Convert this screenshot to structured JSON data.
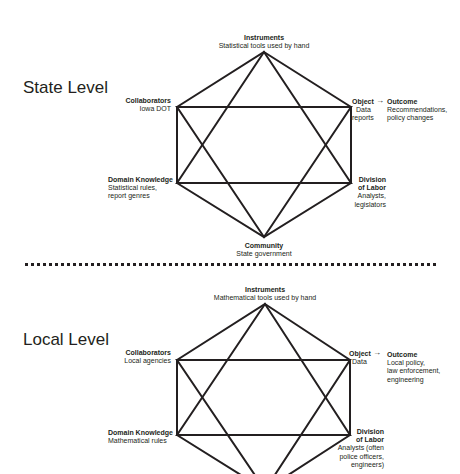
{
  "diagrams": {
    "state": {
      "title": "State Level",
      "instruments": {
        "label": "Instruments",
        "desc": "Statistical tools used by hand"
      },
      "collaborators": {
        "label": "Collaborators",
        "desc": "Iowa DOT"
      },
      "object": {
        "label": "Object",
        "desc1": "Data",
        "desc2": "reports"
      },
      "outcome": {
        "label": "Outcome",
        "desc1": "Recommendations,",
        "desc2": "policy changes"
      },
      "domain_knowledge": {
        "label": "Domain Knowledge",
        "desc1": "Statistical rules,",
        "desc2": "report genres"
      },
      "division_of_labor": {
        "label1": "Division",
        "label2": "of Labor",
        "desc1": "Analysts,",
        "desc2": "legislators"
      },
      "community": {
        "label": "Community",
        "desc": "State government"
      }
    },
    "local": {
      "title": "Local Level",
      "instruments": {
        "label": "Instruments",
        "desc": "Mathematical tools used by hand"
      },
      "collaborators": {
        "label": "Collaborators",
        "desc": "Local agencies"
      },
      "object": {
        "label": "Object",
        "desc1": "Data"
      },
      "outcome": {
        "label": "Outcome",
        "desc1": "Local policy,",
        "desc2": "law enforcement,",
        "desc3": "engineering"
      },
      "domain_knowledge": {
        "label": "Domain Knowledge",
        "desc1": "Mathematical rules"
      },
      "division_of_labor": {
        "label1": "Division",
        "label2": "of Labor",
        "desc1": "Analysts (often",
        "desc2": "police officers,",
        "desc3": "engineers)"
      }
    }
  },
  "symbols": {
    "arrow": "→"
  },
  "colors": {
    "line": "#231f20",
    "background": "#ffffff"
  }
}
